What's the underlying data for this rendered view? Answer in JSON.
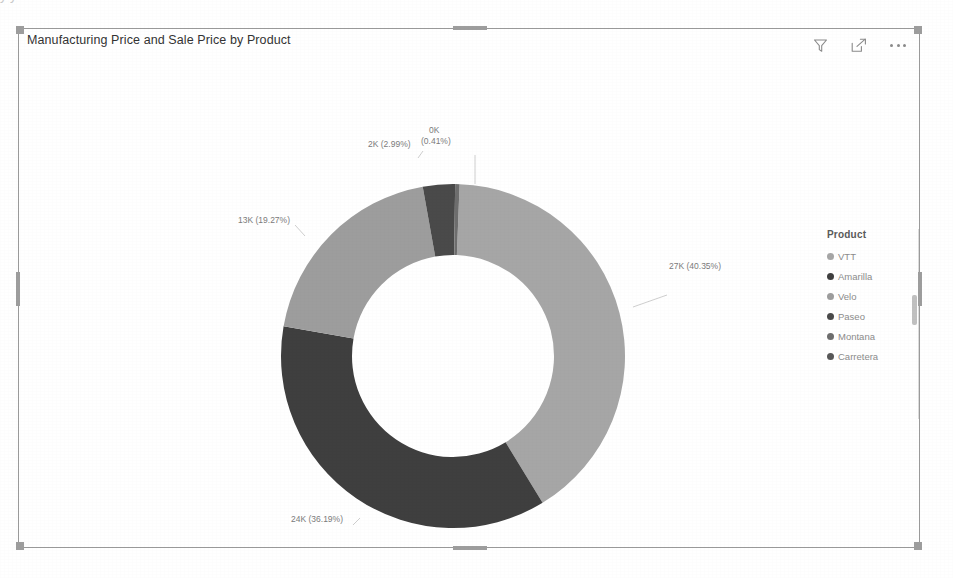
{
  "top_bleed_text": "y                                          y",
  "visual": {
    "title": "Manufacturing Price and Sale Price by Product",
    "header_icons": [
      {
        "name": "filter-icon",
        "label": "Filter"
      },
      {
        "name": "focus-mode-icon",
        "label": "Focus mode"
      },
      {
        "name": "more-options-icon",
        "label": "More options"
      }
    ]
  },
  "legend": {
    "title": "Product",
    "items": [
      {
        "label": "VTT",
        "color": "#a6a6a6"
      },
      {
        "label": "Amarilla",
        "color": "#3f3f3f"
      },
      {
        "label": "Velo",
        "color": "#9d9d9d"
      },
      {
        "label": "Paseo",
        "color": "#4a4a4a"
      },
      {
        "label": "Montana",
        "color": "#6e6e6e"
      },
      {
        "label": "Carretera",
        "color": "#585858"
      }
    ]
  },
  "chart_data": {
    "type": "pie",
    "variant": "donut",
    "title": "Manufacturing Price and Sale Price by Product",
    "legend_title": "Product",
    "legend_position": "right",
    "value_unit": "K",
    "labels_show_value_and_percent": true,
    "categories": [
      "VTT",
      "Amarilla",
      "Velo",
      "Paseo",
      "Montana",
      "Carretera"
    ],
    "slices": [
      {
        "category": "VTT",
        "value_label": "27K",
        "value": 27000,
        "percent": 40.35,
        "percent_label": "(40.35%)",
        "label": "27K (40.35%)",
        "color": "#a6a6a6"
      },
      {
        "category": "Amarilla",
        "value_label": "24K",
        "value": 24000,
        "percent": 36.19,
        "percent_label": "(36.19%)",
        "label": "24K (36.19%)",
        "color": "#3f3f3f"
      },
      {
        "category": "Velo",
        "value_label": "13K",
        "value": 13000,
        "percent": 19.27,
        "percent_label": "(19.27%)",
        "label": "13K (19.27%)",
        "color": "#9d9d9d"
      },
      {
        "category": "Paseo",
        "value_label": "2K",
        "value": 2000,
        "percent": 2.99,
        "percent_label": "(2.99%)",
        "label": "2K (2.99%)",
        "color": "#4a4a4a"
      },
      {
        "category": "Montana",
        "value_label": "0K",
        "value": 300,
        "percent": 0.41,
        "percent_label": "(0.41%)",
        "label": "0K (0.41%)",
        "color": "#6e6e6e"
      },
      {
        "category": "Carretera",
        "value_label": "0K",
        "value": 0,
        "percent": 0.0,
        "percent_label": "(0%)",
        "label": "",
        "color": "#585858"
      }
    ],
    "labels": [
      "27K (40.35%)",
      "24K (36.19%)",
      "13K (19.27%)",
      "2K (2.99%)",
      "0K",
      "(0.41%)"
    ]
  }
}
